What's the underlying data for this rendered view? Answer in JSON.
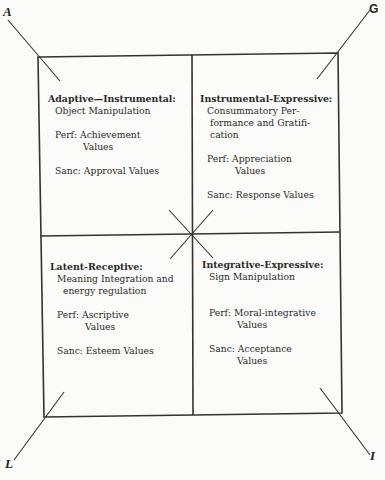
{
  "corners": {
    "A": "A",
    "G": "G",
    "L": "L",
    "I": "I"
  },
  "quadrants": {
    "a": {
      "title": "Adaptive—Instrumental:",
      "desc": [
        "Object Manipulation"
      ],
      "perf_label": "Perf:",
      "perf": [
        "Achievement",
        "Values"
      ],
      "sanc_label": "Sanc:",
      "sanc": [
        "Approval Values"
      ]
    },
    "g": {
      "title": "Instrumental-Expressive:",
      "desc": [
        "Consummatory Per-",
        "formance and Gratifi-",
        "cation"
      ],
      "perf_label": "Perf:",
      "perf": [
        "Appreciation",
        "Values"
      ],
      "sanc_label": "Sanc:",
      "sanc": [
        "Response Values"
      ]
    },
    "l": {
      "title": "Latent-Receptive:",
      "desc": [
        "Meaning Integration and",
        "energy regulation"
      ],
      "perf_label": "Perf:",
      "perf": [
        "Ascriptive",
        "Values"
      ],
      "sanc_label": "Sanc:",
      "sanc": [
        "Esteem Values"
      ]
    },
    "i": {
      "title": "Integrative-Expressive:",
      "desc": [
        "Sign Manipulation"
      ],
      "perf_label": "Perf:",
      "perf": [
        "Moral-integrative",
        "Values"
      ],
      "sanc_label": "Sanc:",
      "sanc": [
        "Acceptance",
        "Values"
      ]
    }
  }
}
